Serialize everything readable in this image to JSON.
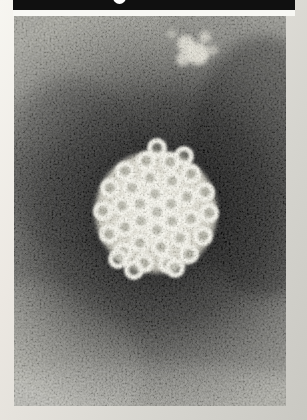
{
  "page": {
    "background_light": "#f7f6f1",
    "background_shade": "#c9c8c2"
  },
  "figure": {
    "top_bar": {
      "color": "#101010",
      "label_marker_color": "#ffffff"
    },
    "micrograph": {
      "subject": "negative-stain-electron-micrograph-virus-particle",
      "base_tone": "#90908a",
      "halo_tone": "#0a0a0a",
      "particle_tone": "#ece9dd",
      "capsomere_ring_tone": "#f7f6ed",
      "capsomere_hole_tone": "rgba(146,145,132,0.55)",
      "debris_tone": "#eceade",
      "particle_center": [
        142,
        196
      ],
      "particle_radius": 61,
      "capsomere_radius": 7.5,
      "capsomere_ring_width": 5,
      "capsomeres": [
        [
          195,
          197
        ],
        [
          189,
          220
        ],
        [
          175,
          238
        ],
        [
          154,
          248
        ],
        [
          130,
          247
        ],
        [
          109,
          236
        ],
        [
          95,
          218
        ],
        [
          89,
          195
        ],
        [
          96,
          172
        ],
        [
          111,
          155
        ],
        [
          132,
          145
        ],
        [
          156,
          146
        ],
        [
          177,
          158
        ],
        [
          191,
          176
        ],
        [
          177,
          203
        ],
        [
          166,
          222
        ],
        [
          147,
          231
        ],
        [
          126,
          227
        ],
        [
          111,
          211
        ],
        [
          108,
          190
        ],
        [
          118,
          172
        ],
        [
          136,
          162
        ],
        [
          158,
          165
        ],
        [
          173,
          181
        ],
        [
          158,
          205
        ],
        [
          143,
          214
        ],
        [
          127,
          205
        ],
        [
          126,
          188
        ],
        [
          141,
          178
        ],
        [
          157,
          188
        ],
        [
          143,
          196
        ],
        [
          104,
          243
        ],
        [
          120,
          254
        ],
        [
          161,
          252
        ],
        [
          143,
          132
        ],
        [
          170,
          140
        ]
      ],
      "debris_blobs": [
        [
          172,
          28,
          9,
          0.85
        ],
        [
          184,
          38,
          11,
          0.9
        ],
        [
          169,
          43,
          7,
          0.8
        ],
        [
          191,
          21,
          6,
          0.7
        ],
        [
          158,
          18,
          5,
          0.45
        ],
        [
          199,
          34,
          5,
          0.6
        ]
      ]
    }
  }
}
